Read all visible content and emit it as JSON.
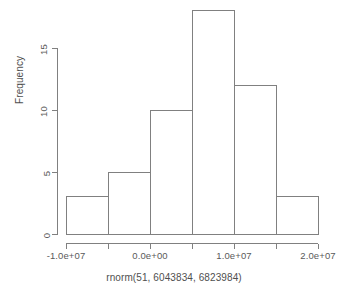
{
  "chart_data": {
    "type": "bar",
    "chart_subtype": "histogram",
    "title": "",
    "subtitle": "",
    "xlabel": "rnorm(51, 6043834, 6823984)",
    "ylabel": "Frequency",
    "categories": [
      "-1.0e+07 to -5.0e+06",
      "-5.0e+06 to 0.0e+00",
      "0.0e+00 to 5.0e+06",
      "5.0e+06 to 1.0e+07",
      "1.0e+07 to 1.5e+07",
      "1.5e+07 to 2.0e+07"
    ],
    "bin_edges": [
      -10000000,
      -5000000,
      0,
      5000000,
      10000000,
      15000000,
      20000000
    ],
    "values": [
      3,
      5,
      10,
      18,
      12,
      3
    ],
    "bin_width": 5000000,
    "xlim": [
      -10000000,
      20000000
    ],
    "ylim": [
      0,
      18
    ],
    "x_tick_values": [
      -10000000,
      -5000000,
      0,
      5000000,
      10000000,
      15000000,
      20000000
    ],
    "x_tick_labels": [
      "-1.0e+07",
      "",
      "0.0e+00",
      "",
      "1.0e+07",
      "",
      "2.0e+07"
    ],
    "y_tick_values": [
      0,
      5,
      10,
      15
    ],
    "y_tick_labels": [
      "0",
      "5",
      "10",
      "15"
    ],
    "grid": false,
    "legend": false,
    "legend_position": "none",
    "bar_fill_color": "#ffffff",
    "bar_border_color": "#808080",
    "axis_color": "#808080",
    "background_color": "#ffffff",
    "text_color": "#4f4f4f",
    "total_count": 51
  },
  "axes": {
    "x": {
      "ticks": [
        {
          "value": -10000000,
          "label": "-1.0e+07"
        },
        {
          "value": -5000000,
          "label": ""
        },
        {
          "value": 0,
          "label": "0.0e+00"
        },
        {
          "value": 5000000,
          "label": ""
        },
        {
          "value": 10000000,
          "label": "1.0e+07"
        },
        {
          "value": 15000000,
          "label": ""
        },
        {
          "value": 20000000,
          "label": "2.0e+07"
        }
      ],
      "title": "rnorm(51, 6043834, 6823984)"
    },
    "y": {
      "ticks": [
        {
          "value": 0,
          "label": "0"
        },
        {
          "value": 5,
          "label": "5"
        },
        {
          "value": 10,
          "label": "10"
        },
        {
          "value": 15,
          "label": "15"
        }
      ],
      "title": "Frequency"
    }
  },
  "bars": [
    {
      "index": 0,
      "label": "-1.0e+07 to -5.0e+06",
      "value": 3
    },
    {
      "index": 1,
      "label": "-5.0e+06 to 0.0e+00",
      "value": 5
    },
    {
      "index": 2,
      "label": "0.0e+00 to 5.0e+06",
      "value": 10
    },
    {
      "index": 3,
      "label": "5.0e+06 to 1.0e+07",
      "value": 18
    },
    {
      "index": 4,
      "label": "1.0e+07 to 1.5e+07",
      "value": 12
    },
    {
      "index": 5,
      "label": "1.5e+07 to 2.0e+07",
      "value": 3
    }
  ]
}
